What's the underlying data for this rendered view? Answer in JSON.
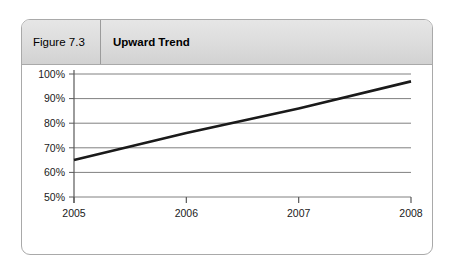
{
  "figure": {
    "number_label": "Figure 7.3",
    "title": "Upward Trend"
  },
  "colors": {
    "card_border": "#a9a9a9",
    "header_background": "#dcdcdc",
    "header_divider": "#9b9b9b",
    "plot_background": "#ffffff",
    "gridline": "#808080",
    "axis": "#595959",
    "series_line": "#1a1a1a",
    "tick_label": "#1a1a1a"
  },
  "chart_data": {
    "type": "line",
    "title": "Upward Trend",
    "subtitle": "",
    "xlabel": "",
    "ylabel": "",
    "x": [
      2005,
      2006,
      2007,
      2008
    ],
    "xtick_labels": [
      "2005",
      "2006",
      "2007",
      "2008"
    ],
    "xlim": [
      2005,
      2008
    ],
    "ylim": [
      50,
      100
    ],
    "ytick_values": [
      100,
      90,
      80,
      70,
      60,
      50
    ],
    "ytick_labels": [
      "100%",
      "90%",
      "80%",
      "70%",
      "60%",
      "50%"
    ],
    "grid": "horizontal",
    "legend": "none",
    "series": [
      {
        "name": "Trend",
        "values": [
          65,
          76,
          86,
          97
        ],
        "line_color": "#1a1a1a",
        "line_width": 2.6,
        "markers": "none"
      }
    ],
    "annotations": []
  }
}
